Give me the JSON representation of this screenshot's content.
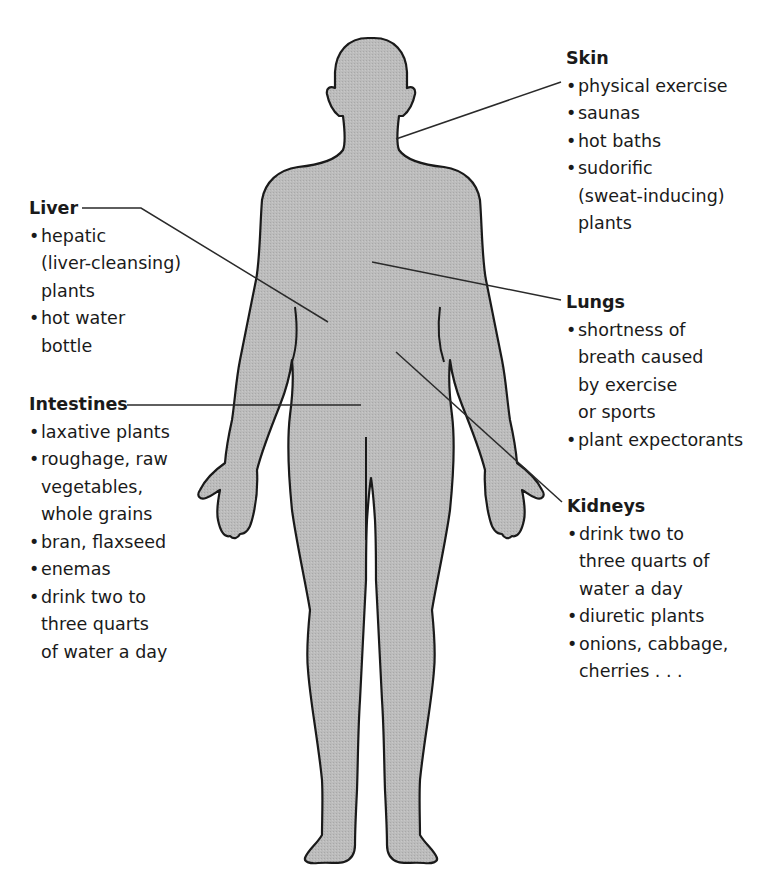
{
  "diagram": {
    "colors": {
      "body_fill": "#b8b8b8",
      "outline": "#1a1a1a",
      "leader_line": "#2a2a2a",
      "text": "#1a1a1a",
      "background": "#ffffff"
    },
    "labels": {
      "liver": {
        "heading": "Liver",
        "items": [
          {
            "lines": [
              "hepatic",
              "(liver-cleansing)",
              "plants"
            ]
          },
          {
            "lines": [
              "hot water",
              "bottle"
            ]
          }
        ]
      },
      "intestines": {
        "heading": "Intestines",
        "items": [
          {
            "lines": [
              "laxative plants"
            ]
          },
          {
            "lines": [
              "roughage, raw",
              "vegetables,",
              "whole grains"
            ]
          },
          {
            "lines": [
              "bran, flaxseed"
            ]
          },
          {
            "lines": [
              "enemas"
            ]
          },
          {
            "lines": [
              "drink two to",
              "three quarts",
              "of water a day"
            ]
          }
        ]
      },
      "skin": {
        "heading": "Skin",
        "items": [
          {
            "lines": [
              "physical exercise"
            ]
          },
          {
            "lines": [
              "saunas"
            ]
          },
          {
            "lines": [
              "hot baths"
            ]
          },
          {
            "lines": [
              "sudorific",
              "(sweat-inducing)",
              "plants"
            ]
          }
        ]
      },
      "lungs": {
        "heading": "Lungs",
        "items": [
          {
            "lines": [
              "shortness of",
              "breath caused",
              "by exercise",
              "or sports"
            ]
          },
          {
            "lines": [
              "plant expectorants"
            ]
          }
        ]
      },
      "kidneys": {
        "heading": "Kidneys",
        "items": [
          {
            "lines": [
              "drink two to",
              "three quarts of",
              "water a day"
            ]
          },
          {
            "lines": [
              "diuretic plants"
            ]
          },
          {
            "lines": [
              "onions, cabbage,",
              "cherries . . ."
            ]
          }
        ]
      }
    }
  }
}
